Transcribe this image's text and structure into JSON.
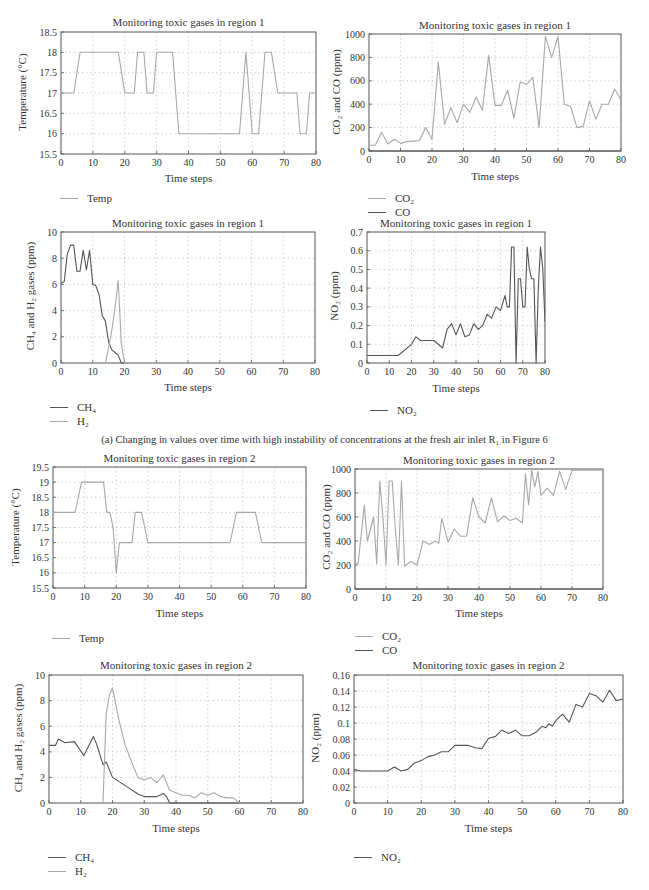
{
  "figure": {
    "caption_a": "(a) Changing in values over time with high instability of concentrations at the fresh air inlet R₁ in Figure 6"
  },
  "colors": {
    "light_line": "#a8a8a8",
    "dark_line": "#555555",
    "axis": "#555555",
    "grid": "#b8b8b8"
  },
  "chart_data": [
    {
      "id": "r1_temp",
      "type": "line",
      "title": "Monitoring toxic gases in region 1",
      "xlabel": "Time steps",
      "ylabel": "Temperature (°C)",
      "xlim": [
        0,
        80
      ],
      "ylim": [
        15.5,
        18.5
      ],
      "xticks": [
        0,
        10,
        20,
        30,
        40,
        50,
        60,
        70,
        80
      ],
      "yticks": [
        15.5,
        16,
        16.5,
        17,
        17.5,
        18,
        18.5
      ],
      "grid": true,
      "legend_position": "below-left",
      "series": [
        {
          "name": "Temp",
          "color": "light",
          "x": [
            0,
            4,
            6,
            7,
            17,
            18,
            20,
            23,
            24,
            26,
            27,
            29,
            30,
            31,
            35,
            37,
            56,
            58,
            60,
            62,
            64,
            66,
            68,
            70,
            74,
            75,
            77,
            78,
            80
          ],
          "y": [
            17,
            17,
            18,
            18,
            18,
            18,
            17,
            17,
            18,
            18,
            17,
            17,
            18,
            18,
            18,
            16,
            16,
            18,
            16,
            16,
            18,
            18,
            17,
            17,
            17,
            16,
            16,
            17,
            17
          ]
        }
      ]
    },
    {
      "id": "r1_co2",
      "type": "line",
      "title": "Monitoring toxic gases in region 1",
      "xlabel": "Time steps",
      "ylabel": "CO₂ and CO (ppm)",
      "xlim": [
        0,
        80
      ],
      "ylim": [
        0,
        1000
      ],
      "xticks": [
        0,
        10,
        20,
        30,
        40,
        50,
        60,
        70,
        80
      ],
      "yticks": [
        0,
        200,
        400,
        600,
        800,
        1000
      ],
      "grid": true,
      "legend_position": "below-left",
      "series": [
        {
          "name": "CO₂",
          "color": "light",
          "x": [
            0,
            2,
            4,
            6,
            8,
            10,
            12,
            14,
            16,
            18,
            20,
            22,
            24,
            26,
            28,
            30,
            32,
            34,
            36,
            38,
            40,
            42,
            44,
            46,
            48,
            50,
            52,
            54,
            56,
            58,
            60,
            62,
            64,
            66,
            68,
            70,
            72,
            74,
            76,
            78,
            80
          ],
          "y": [
            50,
            50,
            160,
            60,
            100,
            65,
            80,
            85,
            90,
            200,
            100,
            760,
            230,
            370,
            240,
            400,
            330,
            460,
            350,
            820,
            390,
            390,
            520,
            280,
            590,
            570,
            630,
            200,
            980,
            800,
            980,
            400,
            380,
            200,
            210,
            430,
            270,
            400,
            400,
            530,
            440
          ]
        },
        {
          "name": "CO",
          "color": "dark",
          "x": [
            0,
            80
          ],
          "y": [
            0,
            0
          ]
        }
      ]
    },
    {
      "id": "r1_ch4_h2",
      "type": "line",
      "title": "Monitoring toxic gases in region 1",
      "xlabel": "Time steps",
      "ylabel": "CH₄ and H₂ gases (ppm)",
      "xlim": [
        0,
        80
      ],
      "ylim": [
        0,
        10
      ],
      "xticks": [
        0,
        10,
        20,
        30,
        40,
        50,
        60,
        70,
        80
      ],
      "yticks": [
        0,
        2,
        4,
        6,
        8,
        10
      ],
      "grid": true,
      "legend_position": "below-left",
      "series": [
        {
          "name": "CH₄",
          "color": "dark",
          "x": [
            0,
            1,
            2,
            3,
            4,
            5,
            6,
            7,
            8,
            9,
            10,
            11,
            12,
            13,
            14,
            15,
            16,
            17,
            18,
            19,
            20
          ],
          "y": [
            6.1,
            6.2,
            8.3,
            9.0,
            9.0,
            7.0,
            7.0,
            8.6,
            7.1,
            8.6,
            6.0,
            5.9,
            5.2,
            3.6,
            3.2,
            1.6,
            1.0,
            0.8,
            0.6,
            0,
            0
          ]
        },
        {
          "name": "H₂",
          "color": "light",
          "x": [
            0,
            14,
            15,
            16,
            17,
            18,
            19,
            20,
            21,
            80
          ],
          "y": [
            0,
            0,
            1.2,
            2.5,
            4.2,
            6.3,
            1.5,
            0,
            0,
            0
          ]
        }
      ]
    },
    {
      "id": "r1_no2",
      "type": "line",
      "title": "Monitoring toxic gases in region 1",
      "xlabel": "Time steps",
      "ylabel": "NO₂ (ppm)",
      "xlim": [
        0,
        80
      ],
      "ylim": [
        0,
        0.7
      ],
      "xticks": [
        0,
        10,
        20,
        30,
        40,
        50,
        60,
        70,
        80
      ],
      "yticks": [
        0,
        0.1,
        0.2,
        0.3,
        0.4,
        0.5,
        0.6,
        0.7
      ],
      "grid": true,
      "legend_position": "below-left",
      "series": [
        {
          "name": "NO₂",
          "color": "dark",
          "x": [
            0,
            14,
            20,
            22,
            24,
            30,
            34,
            36,
            38,
            40,
            42,
            44,
            46,
            48,
            50,
            52,
            54,
            56,
            58,
            60,
            62,
            63,
            64,
            65,
            66,
            67,
            68,
            69,
            70,
            71,
            72,
            73,
            74,
            75,
            76,
            77,
            78,
            79,
            80
          ],
          "y": [
            0.04,
            0.04,
            0.1,
            0.14,
            0.12,
            0.12,
            0.08,
            0.18,
            0.21,
            0.15,
            0.21,
            0.14,
            0.15,
            0.21,
            0.18,
            0.2,
            0.26,
            0.24,
            0.3,
            0.28,
            0.36,
            0.3,
            0.3,
            0.62,
            0.62,
            0.0,
            0.45,
            0.45,
            0.3,
            0.3,
            0.62,
            0.5,
            0.45,
            0.45,
            0.0,
            0.4,
            0.62,
            0.5,
            0.22
          ]
        }
      ]
    },
    {
      "id": "r2_temp",
      "type": "line",
      "title": "Monitoring toxic gases in region 2",
      "xlabel": "Time steps",
      "ylabel": "Temperature (°C)",
      "xlim": [
        0,
        80
      ],
      "ylim": [
        15.5,
        19.5
      ],
      "xticks": [
        0,
        10,
        20,
        30,
        40,
        50,
        60,
        70,
        80
      ],
      "yticks": [
        15.5,
        16,
        16.5,
        17,
        17.5,
        18,
        18.5,
        19,
        19.5
      ],
      "grid": true,
      "legend_position": "below-left",
      "series": [
        {
          "name": "Temp",
          "color": "light",
          "x": [
            0,
            7,
            9,
            15,
            16,
            17,
            18,
            19,
            20,
            21,
            25,
            26,
            28,
            30,
            31,
            56,
            58,
            63,
            64,
            66,
            80
          ],
          "y": [
            18,
            18,
            19,
            19,
            19,
            18,
            18,
            17.5,
            16,
            17,
            17,
            18,
            18,
            17,
            17,
            17,
            18,
            18,
            18,
            17,
            17
          ]
        }
      ]
    },
    {
      "id": "r2_co2",
      "type": "line",
      "title": "Monitoring toxic gases in region 2",
      "xlabel": "Time steps",
      "ylabel": "CO₂ and CO (ppm)",
      "xlim": [
        0,
        80
      ],
      "ylim": [
        0,
        1000
      ],
      "xticks": [
        0,
        10,
        20,
        30,
        40,
        50,
        60,
        70,
        80
      ],
      "yticks": [
        0,
        200,
        400,
        600,
        800,
        1000
      ],
      "grid": true,
      "legend_position": "below-left",
      "series": [
        {
          "name": "CO₂",
          "color": "light",
          "x": [
            0,
            1,
            3,
            4,
            6,
            7,
            8,
            9,
            10,
            11,
            12,
            13,
            14,
            15,
            16,
            18,
            20,
            22,
            24,
            26,
            27,
            28,
            30,
            32,
            34,
            36,
            38,
            40,
            42,
            44,
            46,
            48,
            50,
            52,
            54,
            55,
            56,
            57,
            58,
            59,
            60,
            62,
            64,
            66,
            68,
            70,
            80
          ],
          "y": [
            210,
            210,
            700,
            400,
            600,
            210,
            900,
            600,
            200,
            900,
            900,
            500,
            200,
            900,
            190,
            230,
            200,
            400,
            370,
            400,
            380,
            590,
            390,
            500,
            440,
            440,
            760,
            600,
            550,
            760,
            560,
            610,
            570,
            590,
            550,
            960,
            700,
            990,
            850,
            980,
            780,
            840,
            780,
            980,
            830,
            990,
            990
          ]
        },
        {
          "name": "CO",
          "color": "dark",
          "x": [
            0,
            80
          ],
          "y": [
            0,
            0
          ]
        }
      ]
    },
    {
      "id": "r2_ch4_h2",
      "type": "line",
      "title": "Monitoring toxic gases in region 2",
      "xlabel": "Time steps",
      "ylabel": "CH₄ and H₂ gases (ppm)",
      "xlim": [
        0,
        80
      ],
      "ylim": [
        0,
        10
      ],
      "xticks": [
        0,
        10,
        20,
        30,
        40,
        50,
        60,
        70,
        80
      ],
      "yticks": [
        0,
        2,
        4,
        6,
        8,
        10
      ],
      "grid": true,
      "legend_position": "below-left",
      "series": [
        {
          "name": "CH₄",
          "color": "dark",
          "x": [
            0,
            2,
            3,
            5,
            8,
            11,
            14,
            15,
            17,
            18,
            20,
            25,
            28,
            30,
            34,
            36,
            37,
            38,
            80
          ],
          "y": [
            4.5,
            4.5,
            5.0,
            4.7,
            4.8,
            3.7,
            5.2,
            4.6,
            3.0,
            3.2,
            2.0,
            1.2,
            0.7,
            0.5,
            0.5,
            0.75,
            0.5,
            0,
            0
          ]
        },
        {
          "name": "H₂",
          "color": "light",
          "x": [
            0,
            17,
            18,
            19,
            20,
            22,
            24,
            26,
            28,
            30,
            32,
            34,
            36,
            38,
            40,
            42,
            44,
            46,
            48,
            50,
            52,
            54,
            56,
            58,
            60,
            80
          ],
          "y": [
            0,
            0,
            7.0,
            8.4,
            9.0,
            6.5,
            4.5,
            3.2,
            2.0,
            1.8,
            2.0,
            1.6,
            2.2,
            1.0,
            0.8,
            0.6,
            0.6,
            0.4,
            0.8,
            0.6,
            0.8,
            0.5,
            0.4,
            0.4,
            0,
            0
          ]
        }
      ]
    },
    {
      "id": "r2_no2",
      "type": "line",
      "title": "Monitoring toxic gases in region 2",
      "xlabel": "Time steps",
      "ylabel": "NO₂ (ppm)",
      "xlim": [
        0,
        80
      ],
      "ylim": [
        0,
        0.16
      ],
      "xticks": [
        0,
        10,
        20,
        30,
        40,
        50,
        60,
        70,
        80
      ],
      "yticks": [
        0,
        0.02,
        0.04,
        0.06,
        0.08,
        0.1,
        0.12,
        0.14,
        0.16
      ],
      "grid": true,
      "legend_position": "below-left",
      "series": [
        {
          "name": "NO₂",
          "color": "dark",
          "x": [
            0,
            2,
            10,
            12,
            14,
            16,
            18,
            20,
            22,
            24,
            26,
            28,
            30,
            32,
            34,
            36,
            38,
            40,
            42,
            44,
            46,
            48,
            50,
            52,
            54,
            56,
            57,
            58,
            59,
            60,
            62,
            64,
            66,
            68,
            70,
            72,
            74,
            76,
            78,
            80
          ],
          "y": [
            0.042,
            0.04,
            0.04,
            0.045,
            0.04,
            0.042,
            0.05,
            0.053,
            0.058,
            0.06,
            0.064,
            0.064,
            0.072,
            0.072,
            0.072,
            0.069,
            0.068,
            0.081,
            0.083,
            0.091,
            0.087,
            0.091,
            0.084,
            0.084,
            0.088,
            0.096,
            0.094,
            0.099,
            0.096,
            0.103,
            0.111,
            0.101,
            0.123,
            0.12,
            0.137,
            0.134,
            0.126,
            0.141,
            0.128,
            0.13
          ]
        }
      ]
    }
  ],
  "charts": [
    {
      "title": "Monitoring toxic gases in region 1",
      "xlabel": "Time steps",
      "ylabel": "Temperature (°C)",
      "legend": [
        "Temp"
      ]
    },
    {
      "title": "Monitoring toxic gases in region 1",
      "xlabel": "Time steps",
      "ylabel": "CO₂ and CO (ppm)",
      "legend": [
        "CO₂",
        "CO"
      ]
    },
    {
      "title": "Monitoring toxic gases in region 1",
      "xlabel": "Time steps",
      "ylabel": "CH₄ and H₂ gases (ppm)",
      "legend": [
        "CH₄",
        "H₂"
      ]
    },
    {
      "title": "Monitoring toxic gases in region 1",
      "xlabel": "Time steps",
      "ylabel": "NO₂ (ppm)",
      "legend": [
        "NO₂"
      ]
    },
    {
      "title": "Monitoring toxic gases in region 2",
      "xlabel": "Time steps",
      "ylabel": "Temperature (°C)",
      "legend": [
        "Temp"
      ]
    },
    {
      "title": "Monitoring toxic gases in region 2",
      "xlabel": "Time steps",
      "ylabel": "CO₂ and CO (ppm)",
      "legend": [
        "CO₂",
        "CO"
      ]
    },
    {
      "title": "Monitoring toxic gases in region 2",
      "xlabel": "Time steps",
      "ylabel": "CH₄ and H₂ gases (ppm)",
      "legend": [
        "CH₄",
        "H₂"
      ]
    },
    {
      "title": "Monitoring toxic gases in region 2",
      "xlabel": "Time steps",
      "ylabel": "NO₂ (ppm)",
      "legend": [
        "NO₂"
      ]
    }
  ]
}
